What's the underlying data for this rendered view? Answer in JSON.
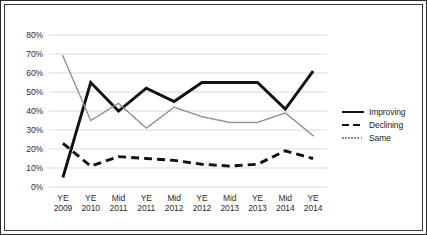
{
  "chart_data": {
    "type": "line",
    "title": "",
    "subtitle": "",
    "xlabel": "",
    "ylabel": "",
    "ylim": [
      0,
      80
    ],
    "ytick_labels": [
      "0%",
      "10%",
      "20%",
      "30%",
      "40%",
      "50%",
      "60%",
      "70%",
      "80%"
    ],
    "ytick_values": [
      0,
      10,
      20,
      30,
      40,
      50,
      60,
      70,
      80
    ],
    "grid": "horizontal",
    "legend_position": "right",
    "categories": [
      {
        "top": "YE",
        "bottom": "2009"
      },
      {
        "top": "YE",
        "bottom": "2010"
      },
      {
        "top": "Mid",
        "bottom": "2011"
      },
      {
        "top": "YE",
        "bottom": "2011"
      },
      {
        "top": "Mid",
        "bottom": "2012"
      },
      {
        "top": "YE",
        "bottom": "2012"
      },
      {
        "top": "Mid",
        "bottom": "2013"
      },
      {
        "top": "YE",
        "bottom": "2013"
      },
      {
        "top": "Mid",
        "bottom": "2014"
      },
      {
        "top": "YE",
        "bottom": "2014"
      }
    ],
    "series": [
      {
        "name": "Improving",
        "style": "solid",
        "color": "#111111",
        "values": [
          5,
          55,
          40,
          52,
          45,
          55,
          55,
          55,
          41,
          61
        ]
      },
      {
        "name": "Declining",
        "style": "dashed",
        "color": "#111111",
        "values": [
          23,
          11,
          16,
          15,
          14,
          12,
          11,
          12,
          19,
          15
        ]
      },
      {
        "name": "Same",
        "style": "dotted",
        "color": "#8e8e8e",
        "values": [
          69,
          35,
          44,
          31,
          42,
          37,
          34,
          34,
          39,
          27
        ]
      }
    ],
    "colors": {
      "grid": "#d9d9d9",
      "axis_text": "#2b2b2b",
      "plot_background": "#ffffff",
      "border": "#2a2a2a"
    }
  },
  "legend": {
    "items": [
      {
        "label": "Improving"
      },
      {
        "label": "Declining"
      },
      {
        "label": "Same"
      }
    ]
  }
}
